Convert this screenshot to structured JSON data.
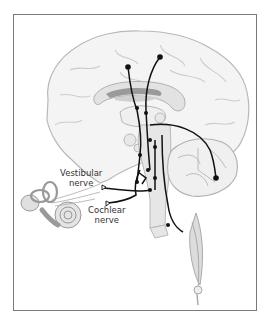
{
  "figure": {
    "labels": {
      "vestibular_line1": "Vestibular",
      "vestibular_line2": "nerve",
      "cochlear_line1": "Cochlear",
      "cochlear_line2": "nerve"
    },
    "colors": {
      "frame": "#7a7a7a",
      "brain_fill": "#f4f4f4",
      "brain_outline": "#b8b8b8",
      "pathway": "#111111",
      "structure_gray": "#d8d8d8",
      "corpus_dark": "#9a9a9a"
    },
    "components": [
      "cerebrum",
      "corpus-callosum",
      "thalamus",
      "brainstem",
      "cerebellum",
      "inner-ear",
      "cochlea",
      "semicircular-canals",
      "spinal-cord",
      "eye-muscle"
    ]
  }
}
